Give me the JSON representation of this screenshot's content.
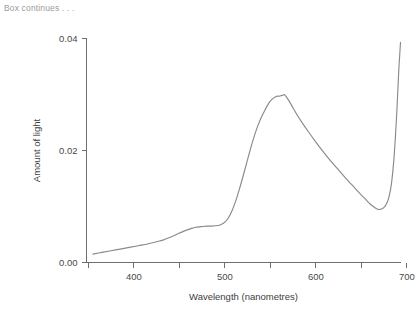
{
  "note": {
    "text": "Box continues . . ."
  },
  "chart_data": {
    "type": "line",
    "title": "",
    "xlabel": "Wavelength (nanometres)",
    "ylabel": "Amount of light",
    "xlim": [
      348,
      693
    ],
    "ylim": [
      0.0,
      0.04
    ],
    "grid": false,
    "legend": "none",
    "line_color": "#8a8a8a",
    "x_ticks": [
      350,
      400,
      450,
      500,
      550,
      600,
      650,
      700
    ],
    "x_tick_labels": [
      "",
      "400",
      "",
      "500",
      "",
      "600",
      "",
      "700"
    ],
    "y_ticks": [
      0.0,
      0.02,
      0.04
    ],
    "y_tick_labels": [
      "0.00",
      "0.02",
      "0.04"
    ],
    "series": [
      {
        "name": "Amount of light",
        "x": [
          355,
          365,
          375,
          385,
          395,
          405,
          415,
          425,
          432,
          440,
          448,
          455,
          462,
          468,
          474,
          480,
          486,
          492,
          496,
          500,
          504,
          508,
          512,
          516,
          520,
          524,
          528,
          532,
          536,
          540,
          544,
          547,
          550,
          553,
          556,
          558,
          560,
          562,
          564,
          566,
          570,
          575,
          580,
          586,
          592,
          600,
          608,
          616,
          624,
          632,
          640,
          648,
          654,
          660,
          664,
          668,
          671,
          674,
          677,
          680,
          683,
          686,
          689,
          691,
          693
        ],
        "y": [
          0.0015,
          0.0018,
          0.0021,
          0.0024,
          0.0027,
          0.003,
          0.0033,
          0.0037,
          0.004,
          0.0045,
          0.0051,
          0.0056,
          0.006,
          0.0063,
          0.0064,
          0.0065,
          0.0065,
          0.0066,
          0.0068,
          0.0072,
          0.008,
          0.0093,
          0.011,
          0.0131,
          0.0154,
          0.0178,
          0.0202,
          0.0224,
          0.0243,
          0.0259,
          0.0272,
          0.0281,
          0.0288,
          0.0293,
          0.0296,
          0.0297,
          0.0297,
          0.0298,
          0.0299,
          0.0299,
          0.029,
          0.0276,
          0.0262,
          0.0247,
          0.0233,
          0.0215,
          0.0198,
          0.0182,
          0.0167,
          0.0152,
          0.0138,
          0.0124,
          0.0114,
          0.0104,
          0.0099,
          0.0095,
          0.0095,
          0.0097,
          0.0103,
          0.0115,
          0.014,
          0.019,
          0.027,
          0.034,
          0.0393
        ]
      }
    ]
  }
}
